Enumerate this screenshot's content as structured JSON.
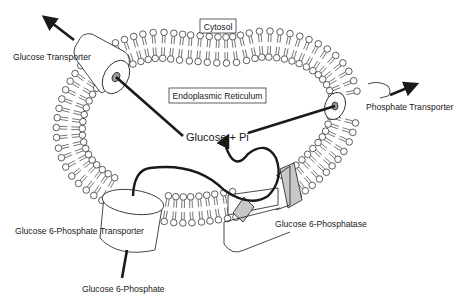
{
  "diagram": {
    "compartments": {
      "cytosol": "Cytosol",
      "er_lumen": "Endoplasmic Reticulum"
    },
    "labels": {
      "glucose_transporter": "Glucose Transporter",
      "phosphate_transporter": "Phosphate Transporter",
      "g6p_transporter": "Glucose 6-Phosphate Transporter",
      "g6pase": "Glucose  6-Phosphatase",
      "g6p": "Glucose 6-Phosphate",
      "products": "Glucose + Pi"
    },
    "colors": {
      "line": "#1a1a1a",
      "membrane_head": "#ffffff",
      "enzyme_fill": "#c8c8c8",
      "background": "#ffffff"
    }
  }
}
